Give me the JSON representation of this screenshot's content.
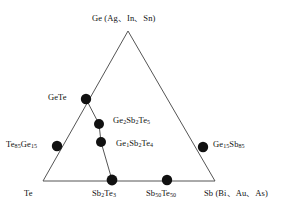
{
  "figure": {
    "kind": "ternary-phase-diagram",
    "system": "Ge-Sb-Te",
    "background_color": "#ffffff",
    "line_color": "#555555",
    "marker_color": "#111111",
    "text_color": "#111111"
  },
  "vertices": {
    "top": "Ge (Ag、In、Sn)",
    "bottom_left": "Te",
    "bottom_right": "Sb (Bi、Au、As)"
  },
  "points": {
    "gete": "GeTe",
    "te85ge15": "Te85Ge15",
    "ge2sb2te5": "Ge2Sb2Te5",
    "ge1sb2te4": "Ge1Sb2Te4",
    "ge15sb85": "Ge15Sb85",
    "sb2te3": "Sb2Te3",
    "sb50te50": "Sb50Te50"
  },
  "chart_data": {
    "type": "scatter",
    "title": "",
    "xlabel": "",
    "ylabel": "",
    "axes": [
      "Ge (Ag、In、Sn)",
      "Sb (Bi、Au、As)",
      "Te"
    ],
    "triangle_pixels": {
      "apex": [
        128,
        31
      ],
      "bottom_left": [
        43,
        181
      ],
      "bottom_right": [
        215,
        181
      ]
    },
    "markers": [
      {
        "label": "GeTe",
        "pixel": [
          86,
          99
        ],
        "on": "left-edge"
      },
      {
        "label": "Te85Ge15",
        "pixel": [
          57,
          146
        ],
        "on": "left-edge"
      },
      {
        "label": "Ge2Sb2Te5",
        "pixel": [
          99,
          124
        ],
        "on": "tie-line"
      },
      {
        "label": "Ge1Sb2Te4",
        "pixel": [
          101,
          142
        ],
        "on": "tie-line"
      },
      {
        "label": "Ge15Sb85",
        "pixel": [
          203,
          147
        ],
        "on": "right-edge"
      },
      {
        "label": "Sb2Te3",
        "pixel": [
          112,
          180
        ],
        "on": "bottom-edge"
      },
      {
        "label": "Sb50Te50",
        "pixel": [
          167,
          180
        ],
        "on": "bottom-edge"
      }
    ],
    "tie_lines": [
      {
        "from": "GeTe",
        "to": "Sb2Te3",
        "via": [
          "Ge2Sb2Te5",
          "Ge1Sb2Te4"
        ]
      }
    ],
    "grid": false,
    "legend": "none"
  }
}
